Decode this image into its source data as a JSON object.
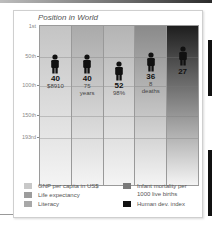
{
  "chart_data": {
    "type": "bar",
    "title": "Position in World",
    "xlabel": "",
    "ylabel": "",
    "y_axis": {
      "inverted": true,
      "ticks": [
        "1st",
        "50th",
        "100th",
        "150th",
        "193rd"
      ],
      "range": [
        1,
        193
      ]
    },
    "grid": true,
    "categories": [
      "GNP per capita in US$",
      "Life expectancy",
      "Literacy",
      "Infant mortality per 1000 live births",
      "Human dev. index"
    ],
    "values": [
      40,
      40,
      52,
      36,
      27
    ],
    "subvalues": [
      "$8910",
      "75 years",
      "98%",
      "8 deaths",
      ""
    ],
    "legend_position": "bottom"
  },
  "chart": {
    "title": "Position in World",
    "yticks": [
      {
        "label": "1st",
        "top": 15
      },
      {
        "label": "50th",
        "top": 45
      },
      {
        "label": "100th",
        "top": 74
      },
      {
        "label": "150th",
        "top": 104
      },
      {
        "label": "193rd",
        "top": 126
      }
    ],
    "columns": [
      {
        "rank": "40",
        "sub1": "$8910",
        "sub2": "",
        "color": "#c4c4c4",
        "person_top": 28
      },
      {
        "rank": "40",
        "sub1": "75",
        "sub2": "years",
        "color": "#aaaaaa",
        "person_top": 28
      },
      {
        "rank": "52",
        "sub1": "98%",
        "sub2": "",
        "color": "#b4b4b4",
        "person_top": 35
      },
      {
        "rank": "36",
        "sub1": "8",
        "sub2": "deaths",
        "color": "#8a8a8a",
        "person_top": 26
      },
      {
        "rank": "27",
        "sub1": "",
        "sub2": "",
        "color": "#1e1e1e",
        "person_top": 20
      }
    ]
  },
  "legend": {
    "items": [
      {
        "label": "GNP per capita in US$",
        "label2": "",
        "color": "#c8c8c8"
      },
      {
        "label": "Life expectancy",
        "label2": "",
        "color": "#9c9c9c"
      },
      {
        "label": "Literacy",
        "label2": "",
        "color": "#a8a8a8"
      },
      {
        "label": "Infant mortality per",
        "label2": "1000 live births",
        "color": "#7a7a7a"
      },
      {
        "label": "Human dev. index",
        "label2": "",
        "color": "#111111"
      }
    ]
  }
}
